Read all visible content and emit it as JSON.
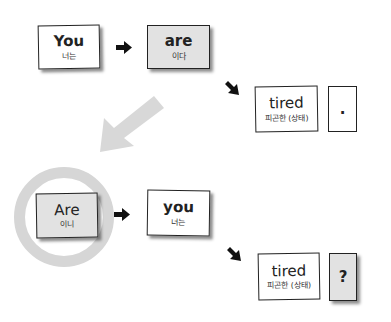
{
  "diagram": {
    "statement_row": {
      "cards": [
        {
          "word": "You",
          "gloss": "너는",
          "style": "white"
        },
        {
          "word": "are",
          "gloss": "이다",
          "style": "gray"
        }
      ],
      "predicate": {
        "word": "tired",
        "gloss": "피곤한 (상태)"
      },
      "end_mark": "."
    },
    "transform_arrow": {
      "direction": "down-left",
      "color": "#d8d8d8"
    },
    "question_row": {
      "cards": [
        {
          "word": "Are",
          "gloss": "이니",
          "style": "gray",
          "highlighted": true
        },
        {
          "word": "you",
          "gloss": "너는",
          "style": "white"
        }
      ],
      "predicate": {
        "word": "tired",
        "gloss": "피곤한 (상태)"
      },
      "end_mark": "?"
    },
    "colors": {
      "card_border": "#222222",
      "card_gray": "#e2e2e2",
      "highlight_ring": "#d6d6d6",
      "arrow": "#111111"
    }
  }
}
